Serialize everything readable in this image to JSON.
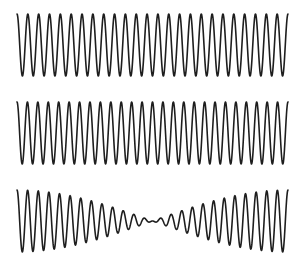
{
  "chart_data": {
    "type": "line",
    "title": "",
    "xlabel": "",
    "ylabel": "",
    "grid": false,
    "legend": [],
    "x_range_px": [
      17,
      288
    ],
    "panels": [
      {
        "name": "wave-a",
        "label": "",
        "kind": "cosine",
        "cycles": 25,
        "amplitude_px": 31,
        "center_y_px": 45
      },
      {
        "name": "wave-b",
        "label": "",
        "kind": "cosine",
        "cycles": 26,
        "amplitude_px": 31,
        "center_y_px": 133
      },
      {
        "name": "wave-sum",
        "label": "",
        "kind": "sum",
        "components": [
          25,
          26
        ],
        "amplitude_px": 15.5,
        "center_y_px": 221,
        "beat_count": 1,
        "min_amplitude_x_px": 152
      }
    ],
    "stroke_color": "#1e1e1e",
    "background": "#ffffff"
  }
}
